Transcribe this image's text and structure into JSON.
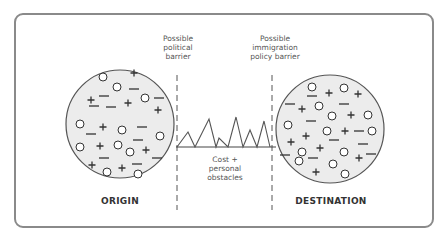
{
  "labels": {
    "political_barrier": "Possible political barrier",
    "political_barrier_lines": [
      "Possible",
      "political",
      "barrier"
    ],
    "immigration_barrier_lines": [
      "Possible",
      "immigration",
      "policy barrier"
    ],
    "obstacles_lines": [
      "Cost +",
      "personal",
      "obstacles"
    ],
    "origin": "ORIGIN",
    "destination": "DESTINATION"
  },
  "colors": {
    "frame": "#8a8a8a",
    "circle_fill": "#ececec",
    "circle_stroke": "#555555",
    "symbol": "#333333"
  },
  "origin_symbols": [
    {
      "t": "o",
      "x": 103,
      "y": 77
    },
    {
      "t": "+",
      "x": 134,
      "y": 73
    },
    {
      "t": "+",
      "x": 91,
      "y": 100
    },
    {
      "t": "-",
      "x": 104,
      "y": 96
    },
    {
      "t": "o",
      "x": 117,
      "y": 87
    },
    {
      "t": "-",
      "x": 134,
      "y": 89
    },
    {
      "t": "-",
      "x": 94,
      "y": 106
    },
    {
      "t": "-",
      "x": 111,
      "y": 107
    },
    {
      "t": "+",
      "x": 128,
      "y": 103
    },
    {
      "t": "o",
      "x": 145,
      "y": 98
    },
    {
      "t": "-",
      "x": 159,
      "y": 98
    },
    {
      "t": "+",
      "x": 158,
      "y": 110
    },
    {
      "t": "o",
      "x": 80,
      "y": 124
    },
    {
      "t": "-",
      "x": 91,
      "y": 134
    },
    {
      "t": "+",
      "x": 103,
      "y": 127
    },
    {
      "t": "o",
      "x": 122,
      "y": 130
    },
    {
      "t": "-",
      "x": 142,
      "y": 127
    },
    {
      "t": "-",
      "x": 138,
      "y": 140
    },
    {
      "t": "o",
      "x": 160,
      "y": 136
    },
    {
      "t": "o",
      "x": 80,
      "y": 147
    },
    {
      "t": "+",
      "x": 100,
      "y": 146
    },
    {
      "t": "o",
      "x": 118,
      "y": 145
    },
    {
      "t": "o",
      "x": 130,
      "y": 152
    },
    {
      "t": "+",
      "x": 146,
      "y": 150
    },
    {
      "t": "-",
      "x": 104,
      "y": 158
    },
    {
      "t": "-",
      "x": 157,
      "y": 158
    },
    {
      "t": "+",
      "x": 92,
      "y": 165
    },
    {
      "t": "o",
      "x": 107,
      "y": 172
    },
    {
      "t": "+",
      "x": 122,
      "y": 168
    },
    {
      "t": "-",
      "x": 137,
      "y": 164
    },
    {
      "t": "o",
      "x": 138,
      "y": 174
    }
  ],
  "destination_symbols": [
    {
      "t": "o",
      "x": 312,
      "y": 87
    },
    {
      "t": "-",
      "x": 312,
      "y": 96
    },
    {
      "t": "+",
      "x": 329,
      "y": 93
    },
    {
      "t": "o",
      "x": 344,
      "y": 88
    },
    {
      "t": "+",
      "x": 358,
      "y": 94
    },
    {
      "t": "-",
      "x": 290,
      "y": 104
    },
    {
      "t": "+",
      "x": 302,
      "y": 109
    },
    {
      "t": "o",
      "x": 319,
      "y": 106
    },
    {
      "t": "-",
      "x": 344,
      "y": 104
    },
    {
      "t": "o",
      "x": 332,
      "y": 116
    },
    {
      "t": "+",
      "x": 351,
      "y": 115
    },
    {
      "t": "o",
      "x": 368,
      "y": 115
    },
    {
      "t": "o",
      "x": 288,
      "y": 125
    },
    {
      "t": "-",
      "x": 311,
      "y": 121
    },
    {
      "t": "+",
      "x": 306,
      "y": 136
    },
    {
      "t": "o",
      "x": 327,
      "y": 131
    },
    {
      "t": "+",
      "x": 345,
      "y": 131
    },
    {
      "t": "-",
      "x": 359,
      "y": 131
    },
    {
      "t": "o",
      "x": 372,
      "y": 131
    },
    {
      "t": "+",
      "x": 291,
      "y": 142
    },
    {
      "t": "-",
      "x": 334,
      "y": 140
    },
    {
      "t": "-",
      "x": 363,
      "y": 144
    },
    {
      "t": "-",
      "x": 285,
      "y": 155
    },
    {
      "t": "o",
      "x": 302,
      "y": 152
    },
    {
      "t": "+",
      "x": 320,
      "y": 148
    },
    {
      "t": "o",
      "x": 344,
      "y": 152
    },
    {
      "t": "+",
      "x": 359,
      "y": 158
    },
    {
      "t": "-",
      "x": 371,
      "y": 154
    },
    {
      "t": "o",
      "x": 299,
      "y": 161
    },
    {
      "t": "-",
      "x": 313,
      "y": 158
    },
    {
      "t": "o",
      "x": 333,
      "y": 164
    },
    {
      "t": "+",
      "x": 316,
      "y": 172
    },
    {
      "t": "o",
      "x": 345,
      "y": 174
    }
  ]
}
